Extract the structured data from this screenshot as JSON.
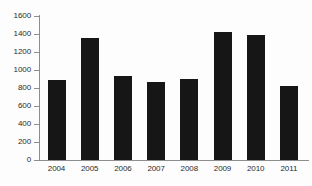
{
  "chart_data": {
    "type": "bar",
    "title": "",
    "subtitle": "",
    "xlabel": "",
    "ylabel": "",
    "categories": [
      "2004",
      "2005",
      "2006",
      "2007",
      "2008",
      "2009",
      "2010",
      "2011"
    ],
    "values": [
      890,
      1355,
      930,
      870,
      900,
      1420,
      1385,
      825
    ],
    "ylim": [
      0,
      1600
    ],
    "ytick_step": 200,
    "yticks": [
      "0",
      "200",
      "400",
      "600",
      "800",
      "1000",
      "1200",
      "1400",
      "1600"
    ],
    "ytick_values": [
      0,
      200,
      400,
      600,
      800,
      1000,
      1200,
      1400,
      1600
    ],
    "grid": false,
    "legend": false,
    "legend_position": "none",
    "bar_color": "#161616",
    "axis_color": "#8d8d8d",
    "text_color": "#2b2b2b",
    "background_color": "#fdfdfd"
  }
}
